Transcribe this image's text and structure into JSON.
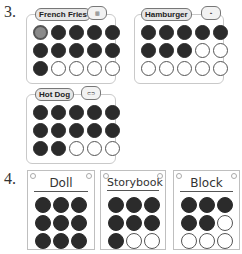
{
  "section3": {
    "number": "3.",
    "cards": [
      {
        "label": "French Fries",
        "icon": "fries-icon",
        "cols": 5,
        "filled": 11,
        "highlighted_first": true,
        "total": 15
      },
      {
        "label": "Hamburger",
        "icon": "hamburger-icon",
        "cols": 5,
        "filled": 8,
        "total": 15
      },
      {
        "label": "Hot Dog",
        "icon": "hotdog-icon",
        "cols": 5,
        "filled": 12,
        "total": 15
      }
    ]
  },
  "section4": {
    "number": "4.",
    "cards": [
      {
        "label": "Doll",
        "cols": 3,
        "filled": 9,
        "total": 9
      },
      {
        "label": "Storybook",
        "cols": 3,
        "filled": 7,
        "total": 9
      },
      {
        "label": "Block",
        "cols": 3,
        "filled": 5,
        "total": 9
      }
    ]
  }
}
